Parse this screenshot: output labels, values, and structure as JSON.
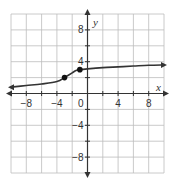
{
  "chart_data": {
    "type": "line",
    "title": "",
    "xlabel": "x",
    "ylabel": "y",
    "xlim": [
      -10,
      10
    ],
    "ylim": [
      -10,
      10
    ],
    "grid": true,
    "grid_step": 2,
    "x_ticks": [
      -8,
      -4,
      0,
      4,
      8
    ],
    "y_ticks": [
      8,
      4,
      -4,
      -8
    ],
    "x_tick_labels": [
      "−8",
      "−4",
      "0",
      "4",
      "8"
    ],
    "y_tick_labels": [
      "8",
      "4",
      "−4",
      "−8"
    ],
    "origin_label": "0",
    "series": [
      {
        "name": "curve",
        "x": [
          -10,
          -8,
          -6,
          -4,
          -3,
          -2.5,
          -2,
          -1.5,
          -1,
          0,
          2,
          4,
          6,
          8,
          10
        ],
        "y": [
          0.8,
          1.0,
          1.2,
          1.5,
          2.0,
          2.3,
          2.6,
          2.9,
          3.0,
          3.1,
          3.25,
          3.35,
          3.45,
          3.55,
          3.6
        ],
        "arrows": "both"
      }
    ],
    "points": [
      {
        "x": -3,
        "y": 2
      },
      {
        "x": -1,
        "y": 3
      }
    ],
    "legend": null
  }
}
